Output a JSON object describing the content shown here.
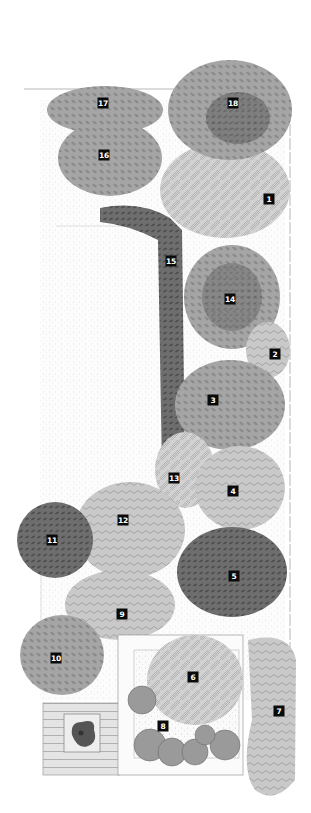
{
  "figure": {
    "type": "garden-planting-plan",
    "style": "grayscale botanical illustration"
  },
  "labels": [
    {
      "id": "1",
      "x": 269,
      "y": 199
    },
    {
      "id": "2",
      "x": 275,
      "y": 354
    },
    {
      "id": "3",
      "x": 213,
      "y": 400
    },
    {
      "id": "4",
      "x": 233,
      "y": 491
    },
    {
      "id": "5",
      "x": 234,
      "y": 576
    },
    {
      "id": "6",
      "x": 193,
      "y": 677
    },
    {
      "id": "7",
      "x": 279,
      "y": 711
    },
    {
      "id": "8",
      "x": 163,
      "y": 726
    },
    {
      "id": "9",
      "x": 122,
      "y": 614
    },
    {
      "id": "10",
      "x": 56,
      "y": 658
    },
    {
      "id": "11",
      "x": 52,
      "y": 540
    },
    {
      "id": "12",
      "x": 123,
      "y": 520
    },
    {
      "id": "13",
      "x": 174,
      "y": 478
    },
    {
      "id": "14",
      "x": 230,
      "y": 299
    },
    {
      "id": "15",
      "x": 171,
      "y": 261
    },
    {
      "id": "16",
      "x": 104,
      "y": 155
    },
    {
      "id": "17",
      "x": 103,
      "y": 103
    },
    {
      "id": "18",
      "x": 233,
      "y": 103
    }
  ],
  "colors": {
    "label_bg": "#0a0a0a",
    "label_text": "#ffffff",
    "foliage_light": "#b8b8b8",
    "foliage_mid": "#8f8f8f",
    "foliage_dark": "#5e5e5e",
    "border_line": "#9a9a9a"
  }
}
